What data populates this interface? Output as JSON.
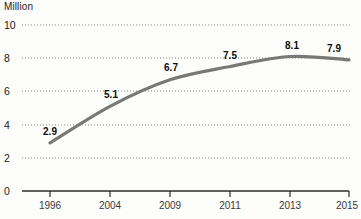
{
  "chart_data": {
    "type": "line",
    "title": "",
    "ylabel": "Million",
    "xlabel": "",
    "categories": [
      "1996",
      "2004",
      "2009",
      "2011",
      "2013",
      "2015"
    ],
    "values": [
      2.9,
      5.1,
      6.7,
      7.5,
      8.1,
      7.9
    ],
    "point_labels": [
      "2.9",
      "5.1",
      "6.7",
      "7.5",
      "8.1",
      "7.9"
    ],
    "ylim": [
      0,
      10
    ],
    "y_ticks": [
      "0",
      "2",
      "4",
      "6",
      "8",
      "10"
    ],
    "x_ticks": [
      "1996",
      "2004",
      "2009",
      "2011",
      "2013",
      "2015"
    ],
    "grid": "horizontal-dotted",
    "legend": "none",
    "series_color": "#787878",
    "grid_color": "#8a8a8a",
    "axis_color": "#2b2b2b",
    "label_color": "#0d0d0d"
  }
}
